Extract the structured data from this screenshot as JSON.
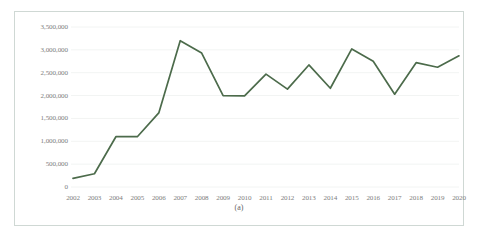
{
  "figure": {
    "caption": "(a)",
    "accent_color": "#4c6b4b",
    "gridline_color": "#f2f4f3",
    "border_color": "#cfd8d4",
    "label_color": "#808080"
  },
  "chart_data": {
    "type": "line",
    "title": "",
    "subtitle": "",
    "xlabel": "",
    "ylabel": "",
    "categories": [
      "2002",
      "2003",
      "2004",
      "2005",
      "2006",
      "2007",
      "2008",
      "2009",
      "2010",
      "2011",
      "2012",
      "2013",
      "2014",
      "2015",
      "2016",
      "2017",
      "2018",
      "2019",
      "2020"
    ],
    "x": [
      2002,
      2003,
      2004,
      2005,
      2006,
      2007,
      2008,
      2009,
      2010,
      2011,
      2012,
      2013,
      2014,
      2015,
      2016,
      2017,
      2018,
      2019,
      2020
    ],
    "values": [
      190000,
      290000,
      1100000,
      1100000,
      1620000,
      3200000,
      2930000,
      2000000,
      1995000,
      2470000,
      2140000,
      2670000,
      2160000,
      3020000,
      2750000,
      2030000,
      2720000,
      2620000,
      2870000
    ],
    "series": [
      {
        "name": "series-1",
        "color": "#4c6b4b",
        "values": [
          190000,
          290000,
          1100000,
          1100000,
          1620000,
          3200000,
          2930000,
          2000000,
          1995000,
          2470000,
          2140000,
          2670000,
          2160000,
          3020000,
          2750000,
          2030000,
          2720000,
          2620000,
          2870000
        ]
      }
    ],
    "ylim": [
      0,
      3500000
    ],
    "yticks": [
      0,
      500000,
      1000000,
      1500000,
      2000000,
      2500000,
      3000000,
      3500000
    ],
    "ytick_labels": [
      "0",
      "500,000",
      "1,000,000",
      "1,500,000",
      "2,000,000",
      "2,500,000",
      "3,000,000",
      "3,500,000"
    ],
    "xtick_labels": [
      "2002",
      "2003",
      "2004",
      "2005",
      "2006",
      "2007",
      "2008",
      "2009",
      "2010",
      "2011",
      "2012",
      "2013",
      "2014",
      "2015",
      "2016",
      "2017",
      "2018",
      "2019",
      "2020"
    ],
    "grid": true,
    "grid_axis": "y",
    "legend": false,
    "legend_position": "none",
    "markers": false,
    "annotations": []
  }
}
